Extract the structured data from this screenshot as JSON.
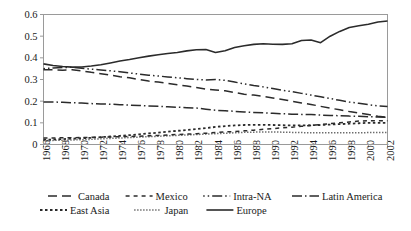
{
  "chart_data": {
    "type": "line",
    "title": "",
    "xlabel": "",
    "ylabel": "",
    "ylim": [
      0,
      0.6
    ],
    "ytick_labels": [
      "0",
      "0.1",
      "0.2",
      "0.3",
      "0.4",
      "0.5",
      "0.6"
    ],
    "ytick_values": [
      0,
      0.1,
      0.2,
      0.3,
      0.4,
      0.5,
      0.6
    ],
    "grid": false,
    "legend_position": "bottom",
    "x": [
      1966,
      1967,
      1968,
      1969,
      1970,
      1971,
      1972,
      1973,
      1974,
      1975,
      1976,
      1977,
      1978,
      1979,
      1980,
      1981,
      1982,
      1983,
      1984,
      1985,
      1986,
      1987,
      1988,
      1989,
      1990,
      1991,
      1992,
      1993,
      1994,
      1995,
      1996,
      1997,
      1998,
      1999,
      2000,
      2001,
      2002
    ],
    "xtick_labels": [
      "1966",
      "1968",
      "1970",
      "1972",
      "1974",
      "1976",
      "1978",
      "1980",
      "1982",
      "1984",
      "1986",
      "1988",
      "1990",
      "1992",
      "1994",
      "1996",
      "1998",
      "2000",
      "2002"
    ],
    "xtick_values": [
      1966,
      1968,
      1970,
      1972,
      1974,
      1976,
      1978,
      1980,
      1982,
      1984,
      1986,
      1988,
      1990,
      1992,
      1994,
      1996,
      1998,
      2000,
      2002
    ],
    "series": [
      {
        "name": "Canada",
        "dash": "9,5",
        "width": 1.5,
        "values": [
          0.345,
          0.345,
          0.343,
          0.345,
          0.34,
          0.333,
          0.327,
          0.32,
          0.313,
          0.308,
          0.3,
          0.293,
          0.288,
          0.282,
          0.276,
          0.27,
          0.263,
          0.256,
          0.252,
          0.248,
          0.24,
          0.232,
          0.228,
          0.222,
          0.215,
          0.208,
          0.2,
          0.192,
          0.185,
          0.176,
          0.168,
          0.16,
          0.152,
          0.145,
          0.138,
          0.13,
          0.125
        ]
      },
      {
        "name": "Mexico",
        "dash": "4,4",
        "width": 1.5,
        "values": [
          0.03,
          0.03,
          0.031,
          0.031,
          0.032,
          0.033,
          0.034,
          0.035,
          0.036,
          0.037,
          0.038,
          0.04,
          0.042,
          0.044,
          0.046,
          0.048,
          0.05,
          0.052,
          0.055,
          0.058,
          0.06,
          0.063,
          0.066,
          0.07,
          0.073,
          0.077,
          0.08,
          0.084,
          0.088,
          0.092,
          0.096,
          0.1,
          0.104,
          0.108,
          0.11,
          0.11,
          0.11
        ]
      },
      {
        "name": "Intra-NA",
        "dash": "1.5,3,1.5,3,10,3",
        "width": 1.5,
        "values": [
          0.35,
          0.353,
          0.355,
          0.357,
          0.352,
          0.348,
          0.344,
          0.34,
          0.336,
          0.33,
          0.325,
          0.32,
          0.316,
          0.312,
          0.308,
          0.304,
          0.3,
          0.298,
          0.3,
          0.296,
          0.288,
          0.28,
          0.272,
          0.266,
          0.258,
          0.25,
          0.244,
          0.236,
          0.228,
          0.22,
          0.212,
          0.204,
          0.196,
          0.19,
          0.184,
          0.178,
          0.175
        ]
      },
      {
        "name": "Latin America",
        "dash": "10,3,1.5,3",
        "width": 1.5,
        "values": [
          0.196,
          0.196,
          0.195,
          0.193,
          0.191,
          0.189,
          0.187,
          0.186,
          0.184,
          0.182,
          0.18,
          0.178,
          0.176,
          0.174,
          0.172,
          0.17,
          0.168,
          0.163,
          0.158,
          0.156,
          0.153,
          0.15,
          0.148,
          0.146,
          0.144,
          0.142,
          0.14,
          0.139,
          0.138,
          0.136,
          0.134,
          0.133,
          0.131,
          0.13,
          0.128,
          0.127,
          0.126
        ]
      },
      {
        "name": "East Asia",
        "dash": "2.5,2.5",
        "width": 1.8,
        "values": [
          0.022,
          0.023,
          0.025,
          0.027,
          0.029,
          0.031,
          0.034,
          0.037,
          0.04,
          0.043,
          0.047,
          0.051,
          0.055,
          0.059,
          0.063,
          0.067,
          0.071,
          0.076,
          0.081,
          0.085,
          0.088,
          0.09,
          0.091,
          0.091,
          0.09,
          0.089,
          0.088,
          0.088,
          0.089,
          0.09,
          0.092,
          0.094,
          0.096,
          0.098,
          0.1,
          0.1,
          0.1
        ]
      },
      {
        "name": "Japan",
        "dash": "1,2",
        "width": 1.5,
        "values": [
          0.018,
          0.019,
          0.02,
          0.021,
          0.022,
          0.024,
          0.026,
          0.028,
          0.03,
          0.032,
          0.034,
          0.036,
          0.038,
          0.04,
          0.042,
          0.044,
          0.046,
          0.048,
          0.05,
          0.052,
          0.054,
          0.056,
          0.057,
          0.058,
          0.058,
          0.057,
          0.056,
          0.055,
          0.054,
          0.054,
          0.054,
          0.054,
          0.054,
          0.054,
          0.055,
          0.055,
          0.055
        ]
      },
      {
        "name": "Europe",
        "dash": "",
        "width": 1.6,
        "values": [
          0.372,
          0.365,
          0.36,
          0.357,
          0.358,
          0.362,
          0.368,
          0.376,
          0.385,
          0.392,
          0.4,
          0.408,
          0.414,
          0.42,
          0.425,
          0.432,
          0.437,
          0.438,
          0.425,
          0.433,
          0.448,
          0.456,
          0.462,
          0.465,
          0.463,
          0.462,
          0.465,
          0.48,
          0.482,
          0.47,
          0.5,
          0.522,
          0.54,
          0.548,
          0.555,
          0.565,
          0.57
        ]
      }
    ]
  },
  "legend": {
    "rows": [
      [
        {
          "label": "Canada",
          "series": "Canada"
        },
        {
          "label": "Mexico",
          "series": "Mexico"
        },
        {
          "label": "Intra-NA",
          "series": "Intra-NA"
        },
        {
          "label": "Latin America",
          "series": "Latin America"
        }
      ],
      [
        {
          "label": "East Asia",
          "series": "East Asia"
        },
        {
          "label": "Japan",
          "series": "Japan"
        },
        {
          "label": "Europe",
          "series": "Europe"
        }
      ]
    ]
  },
  "colors": {
    "line": "#2b2b2b",
    "frame": "#9a9a9a",
    "text": "#1a1a1a",
    "background": "#ffffff"
  }
}
